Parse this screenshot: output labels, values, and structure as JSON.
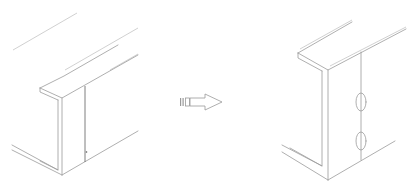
{
  "diagram": {
    "figures": [
      {
        "id": "before",
        "label": "",
        "elements": [
          "c-channel-beam",
          "vertical-seam-line",
          "small-mark"
        ]
      },
      {
        "id": "after",
        "label": "",
        "elements": [
          "c-channel-beam",
          "vertical-seam-line",
          "oval-hole-top",
          "oval-hole-bottom"
        ]
      }
    ],
    "arrow": {
      "direction": "right",
      "icon": "hollow-arrow-right-icon"
    },
    "colors": {
      "line": "#9a9a9a",
      "background": "#ffffff"
    }
  }
}
